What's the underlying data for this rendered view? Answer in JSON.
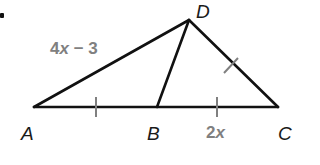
{
  "figure": {
    "type": "triangle-with-cevian",
    "vertices": {
      "A": {
        "label": "A",
        "x": 34,
        "y": 107
      },
      "B": {
        "label": "B",
        "x": 157,
        "y": 107
      },
      "C": {
        "label": "C",
        "x": 278,
        "y": 107
      },
      "D": {
        "label": "D",
        "x": 189,
        "y": 20
      }
    },
    "segments": [
      {
        "name": "AD",
        "from": "A",
        "to": "D"
      },
      {
        "name": "DB",
        "from": "D",
        "to": "B"
      },
      {
        "name": "DC",
        "from": "D",
        "to": "C"
      },
      {
        "name": "AC",
        "from": "A",
        "to": "C"
      }
    ],
    "tick_marks": [
      {
        "segment": "AB",
        "count": 1
      },
      {
        "segment": "BC",
        "count": 1
      },
      {
        "segment": "DC",
        "count": 1
      }
    ],
    "measures": {
      "AD": {
        "coef": "4",
        "var": "x",
        "rest": " − 3"
      },
      "BC": {
        "coef": "2",
        "var": "x",
        "rest": ""
      }
    },
    "colors": {
      "line": "#111111",
      "tick": "#808080",
      "measure_text": "#808080",
      "vertex_text": "#1a1a1a"
    }
  }
}
